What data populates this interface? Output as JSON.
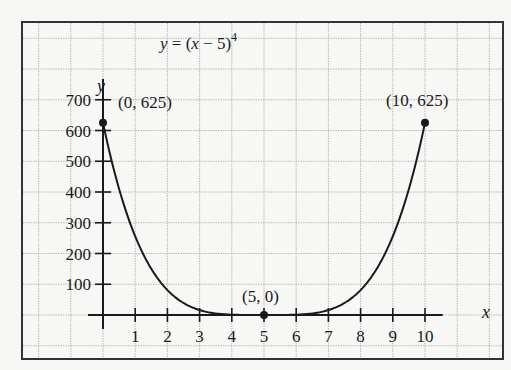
{
  "chart_data": {
    "type": "line",
    "title_parts": {
      "lhs": "y",
      "eq": " = (",
      "var": "x",
      "rest": " − 5)",
      "exp": "4"
    },
    "xlabel": "x",
    "ylabel": "y",
    "xlim": [
      0,
      10.5
    ],
    "ylim": [
      0,
      750
    ],
    "x_ticks": [
      1,
      2,
      3,
      4,
      5,
      6,
      7,
      8,
      9,
      10
    ],
    "x_tick_labels": [
      "1",
      "2",
      "3",
      "4",
      "5",
      "6",
      "7",
      "8",
      "9",
      "10"
    ],
    "y_ticks": [
      100,
      200,
      300,
      400,
      500,
      600,
      700
    ],
    "y_tick_labels": [
      "100",
      "200",
      "300",
      "400",
      "500",
      "600",
      "700"
    ],
    "grid": true,
    "series": [
      {
        "name": "y = (x − 5)^4",
        "function": "(x-5)^4",
        "x": [
          0,
          0.5,
          1,
          1.5,
          2,
          2.5,
          3,
          3.5,
          4,
          4.5,
          5,
          5.5,
          6,
          6.5,
          7,
          7.5,
          8,
          8.5,
          9,
          9.5,
          10
        ],
        "values": [
          625,
          410.06,
          256,
          150.06,
          81,
          39.06,
          16,
          5.06,
          1,
          0.06,
          0,
          0.06,
          1,
          5.06,
          16,
          39.06,
          81,
          150.06,
          256,
          410.06,
          625
        ]
      }
    ],
    "annotations": [
      {
        "label": "(0, 625)",
        "x": 0,
        "y": 625
      },
      {
        "label": "(5, 0)",
        "x": 5,
        "y": 0
      },
      {
        "label": "(10, 625)",
        "x": 10,
        "y": 625
      }
    ]
  },
  "colors": {
    "background": "#f7f7f5",
    "grid": "#b8b8b8",
    "frame": "#333333",
    "axis": "#1a1a1a",
    "curve": "#1a1a1a"
  }
}
